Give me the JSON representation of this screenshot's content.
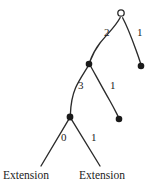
{
  "diagram": {
    "type": "tree",
    "title": "",
    "background_color": "#ffffff",
    "stroke_color": "#2b2b2b",
    "node_fill_color": "#1a1a1a",
    "root_fill_color": "#ffffff",
    "nodes": [
      {
        "id": "root",
        "kind": "open-circle",
        "x": 121,
        "y": 13,
        "label": ""
      },
      {
        "id": "n1",
        "kind": "filled-circle",
        "x": 89,
        "y": 64,
        "label": ""
      },
      {
        "id": "tipA",
        "kind": "filled-circle",
        "x": 141,
        "y": 66,
        "label": ""
      },
      {
        "id": "n2",
        "kind": "filled-circle",
        "x": 70,
        "y": 117,
        "label": ""
      },
      {
        "id": "tipB",
        "kind": "filled-circle",
        "x": 119,
        "y": 119,
        "label": ""
      },
      {
        "id": "tipC",
        "kind": "terminus",
        "x": 41,
        "y": 166,
        "label": "Extension"
      },
      {
        "id": "tipD",
        "kind": "terminus",
        "x": 100,
        "y": 166,
        "label": "Extension"
      }
    ],
    "edges": [
      {
        "from": "root",
        "to": "n1",
        "label": "2",
        "label_x": 104,
        "label_y": 33
      },
      {
        "from": "root",
        "to": "tipA",
        "label": "1",
        "label_x": 136,
        "label_y": 33
      },
      {
        "from": "n1",
        "to": "n2",
        "label": "3",
        "label_x": 78,
        "label_y": 86
      },
      {
        "from": "n1",
        "to": "tipB",
        "label": "1",
        "label_x": 110,
        "label_y": 86
      },
      {
        "from": "n2",
        "to": "tipC",
        "label": "0",
        "label_x": 61,
        "label_y": 138
      },
      {
        "from": "n2",
        "to": "tipD",
        "label": "1",
        "label_x": 90,
        "label_y": 138
      }
    ],
    "leaf_labels": [
      {
        "text": "Extension",
        "x": 3,
        "y": 170
      },
      {
        "text": "Extension",
        "x": 79,
        "y": 170
      }
    ]
  }
}
